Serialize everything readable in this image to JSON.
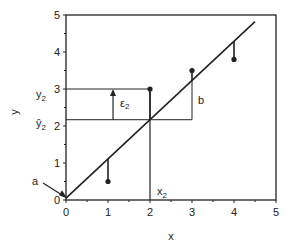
{
  "chart_data": {
    "type": "scatter",
    "title": "",
    "xlabel": "x",
    "ylabel": "y",
    "xlim": [
      0,
      5
    ],
    "ylim": [
      0,
      5
    ],
    "x_ticks": [
      "0",
      "1",
      "2",
      "3",
      "4",
      "5"
    ],
    "y_ticks": [
      "0",
      "1",
      "2",
      "3",
      "4",
      "5"
    ],
    "grid": false,
    "points": [
      {
        "x": 1,
        "y": 0.5
      },
      {
        "x": 2,
        "y": 3.0
      },
      {
        "x": 3,
        "y": 3.5
      },
      {
        "x": 4,
        "y": 3.8
      }
    ],
    "regression_line": {
      "intercept": 0.05,
      "slope": 1.06,
      "x_start": 0,
      "x_end": 4.5
    },
    "annotations": {
      "a": "a",
      "b": "b",
      "epsilon": "ε",
      "epsilon_sub": "2",
      "y2": "y",
      "y2_sub": "2",
      "yhat2": "ŷ",
      "yhat2_sub": "2",
      "x2": "x",
      "x2_sub": "2"
    },
    "highlight_x": 2,
    "highlight_y": 3.0,
    "highlight_yhat": 2.17
  }
}
